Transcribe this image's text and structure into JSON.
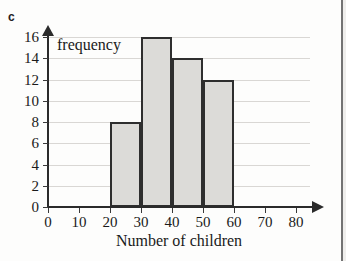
{
  "item_letter": "c",
  "chart_data": {
    "type": "bar",
    "title": "",
    "xlabel": "Number of children",
    "ylabel": "frequency",
    "categories": [
      "20-30",
      "30-40",
      "40-50",
      "50-60"
    ],
    "bin_edges": [
      20,
      30,
      40,
      50,
      60
    ],
    "values": [
      8,
      16,
      14,
      12
    ],
    "xlim": [
      0,
      80
    ],
    "ylim": [
      0,
      16
    ],
    "x_ticks": [
      0,
      10,
      20,
      30,
      40,
      50,
      60,
      70,
      80
    ],
    "y_ticks": [
      0,
      2,
      4,
      6,
      8,
      10,
      12,
      14,
      16
    ],
    "grid": true,
    "legend": "none",
    "bar_fill_color": "#dcdbd8",
    "bar_edge_color": "#2e2e2e",
    "axis_color": "#2b2b2b",
    "gridline_color": "#d9d7d4"
  }
}
